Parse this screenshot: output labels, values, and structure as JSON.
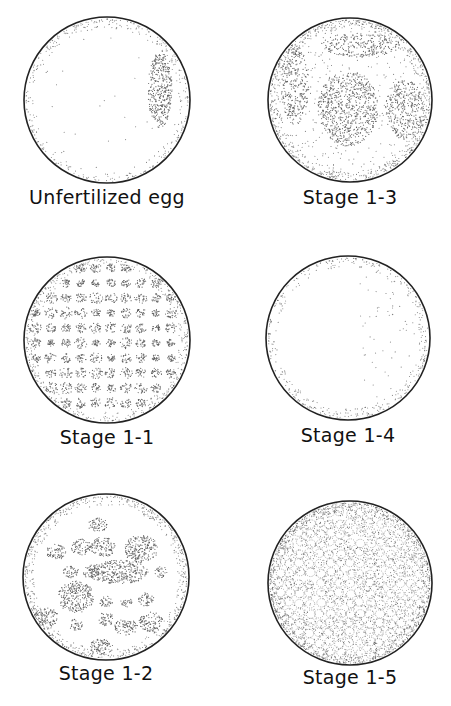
{
  "figure": {
    "panels": [
      {
        "id": "unfertilized",
        "label": "Unfertilized egg",
        "cx": 107,
        "cy": 100,
        "r": 83,
        "label_y": 186,
        "pattern": "crescent"
      },
      {
        "id": "stage-1-3",
        "label": "Stage 1-3",
        "cx": 350,
        "cy": 100,
        "r": 82,
        "label_y": 186,
        "pattern": "blotches-large"
      },
      {
        "id": "stage-1-1",
        "label": "Stage 1-1",
        "cx": 107,
        "cy": 340,
        "r": 83,
        "label_y": 426,
        "pattern": "spots"
      },
      {
        "id": "stage-1-4",
        "label": "Stage 1-4",
        "cx": 348,
        "cy": 338,
        "r": 82,
        "label_y": 424,
        "pattern": "sparse"
      },
      {
        "id": "stage-1-2",
        "label": "Stage 1-2",
        "cx": 106,
        "cy": 577,
        "r": 83,
        "label_y": 662,
        "pattern": "patches"
      },
      {
        "id": "stage-1-5",
        "label": "Stage 1-5",
        "cx": 350,
        "cy": 583,
        "r": 82,
        "label_y": 666,
        "pattern": "cells"
      }
    ],
    "colors": {
      "ink": "#222222",
      "stipple": "#555555",
      "background": "#ffffff"
    }
  }
}
